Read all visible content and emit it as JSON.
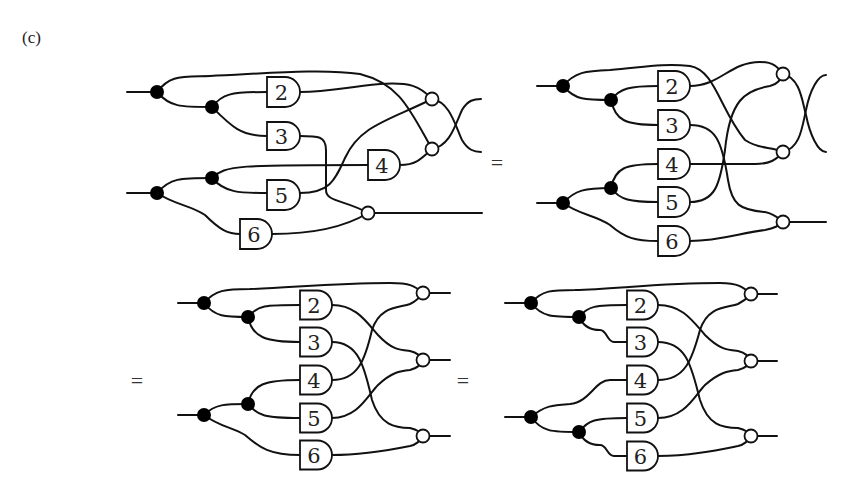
{
  "figure": {
    "panel_label": "(c)",
    "equals_sign": "=",
    "colors": {
      "stroke": "#111111",
      "copy_dot": "#000000",
      "merge_node_fill": "#ffffff",
      "background": "#ffffff"
    }
  },
  "diagrams": [
    {
      "id": "top-left",
      "gates": [
        {
          "label": "2",
          "x": 267,
          "y": 92,
          "w": 33,
          "h": 30
        },
        {
          "label": "3",
          "x": 267,
          "y": 136,
          "w": 33,
          "h": 28
        },
        {
          "label": "4",
          "x": 368,
          "y": 165,
          "w": 32,
          "h": 30
        },
        {
          "label": "5",
          "x": 267,
          "y": 195,
          "w": 33,
          "h": 30
        },
        {
          "label": "6",
          "x": 240,
          "y": 234,
          "w": 32,
          "h": 30
        }
      ]
    },
    {
      "id": "top-right",
      "gates": [
        {
          "label": "2",
          "x": 658,
          "y": 86,
          "w": 32,
          "h": 30
        },
        {
          "label": "3",
          "x": 658,
          "y": 125,
          "w": 32,
          "h": 30
        },
        {
          "label": "4",
          "x": 658,
          "y": 164,
          "w": 32,
          "h": 30
        },
        {
          "label": "5",
          "x": 658,
          "y": 202,
          "w": 32,
          "h": 30
        },
        {
          "label": "6",
          "x": 658,
          "y": 241,
          "w": 32,
          "h": 30
        }
      ]
    },
    {
      "id": "bottom-left",
      "gates": [
        {
          "label": "2",
          "x": 300,
          "y": 305,
          "w": 32,
          "h": 29
        },
        {
          "label": "3",
          "x": 300,
          "y": 342,
          "w": 32,
          "h": 29
        },
        {
          "label": "4",
          "x": 300,
          "y": 380,
          "w": 32,
          "h": 29
        },
        {
          "label": "5",
          "x": 300,
          "y": 418,
          "w": 32,
          "h": 29
        },
        {
          "label": "6",
          "x": 300,
          "y": 455,
          "w": 32,
          "h": 29
        }
      ]
    },
    {
      "id": "bottom-right",
      "gates": [
        {
          "label": "2",
          "x": 627,
          "y": 305,
          "w": 31,
          "h": 29
        },
        {
          "label": "3",
          "x": 627,
          "y": 342,
          "w": 31,
          "h": 29
        },
        {
          "label": "4",
          "x": 627,
          "y": 380,
          "w": 31,
          "h": 29
        },
        {
          "label": "5",
          "x": 627,
          "y": 418,
          "w": 31,
          "h": 29
        },
        {
          "label": "6",
          "x": 627,
          "y": 456,
          "w": 31,
          "h": 29
        }
      ]
    }
  ]
}
